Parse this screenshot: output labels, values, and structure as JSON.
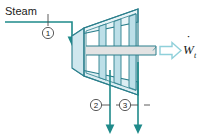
{
  "diagram": {
    "type": "schematic",
    "canvas": {
      "width": 202,
      "height": 139,
      "background": "#ffffff"
    },
    "colors": {
      "stream_line": "#1f8a8a",
      "arrow_fill": "#1f8a8a",
      "casing_outline": "#2b7f8c",
      "casing_fill": "#cfe7ee",
      "blade_fill": "#bcdfe8",
      "shaft_fill": "#e3e3e3",
      "shaft_outline": "#2b7f8c",
      "work_arrow_outline": "#8fd0da",
      "text": "#1a1a1a"
    },
    "labels": {
      "inlet": "Steam",
      "work": "W",
      "work_subscript": "t",
      "work_dot": "̇"
    },
    "stations": [
      {
        "id": "1",
        "label": "1",
        "role": "inlet",
        "cx": 48,
        "cy": 33
      },
      {
        "id": "2",
        "label": "2",
        "role": "extraction-outlet",
        "cx": 96,
        "cy": 105
      },
      {
        "id": "3",
        "label": "3",
        "role": "exhaust-outlet",
        "cx": 125,
        "cy": 105
      }
    ],
    "streams": [
      {
        "name": "steam-inlet",
        "direction": "down-into-turbine"
      },
      {
        "name": "outlet-2",
        "direction": "down"
      },
      {
        "name": "outlet-3",
        "direction": "down"
      }
    ],
    "work_output": {
      "name": "turbine-work",
      "direction": "right"
    }
  }
}
